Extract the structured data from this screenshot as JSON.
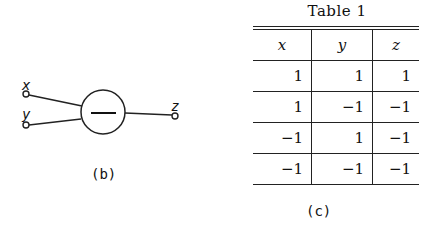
{
  "diagram_b": {
    "caption": "(b)",
    "inputs": [
      {
        "label": "x"
      },
      {
        "label": "y"
      }
    ],
    "output": {
      "label": "z"
    },
    "node_symbol": "—"
  },
  "table_c": {
    "title": "Table  1",
    "caption": "(c)",
    "headers": [
      "x",
      "y",
      "z"
    ],
    "rows": [
      [
        "1",
        "1",
        "1"
      ],
      [
        "1",
        "−1",
        "−1"
      ],
      [
        "−1",
        "1",
        "−1"
      ],
      [
        "−1",
        "−1",
        "−1"
      ]
    ]
  }
}
